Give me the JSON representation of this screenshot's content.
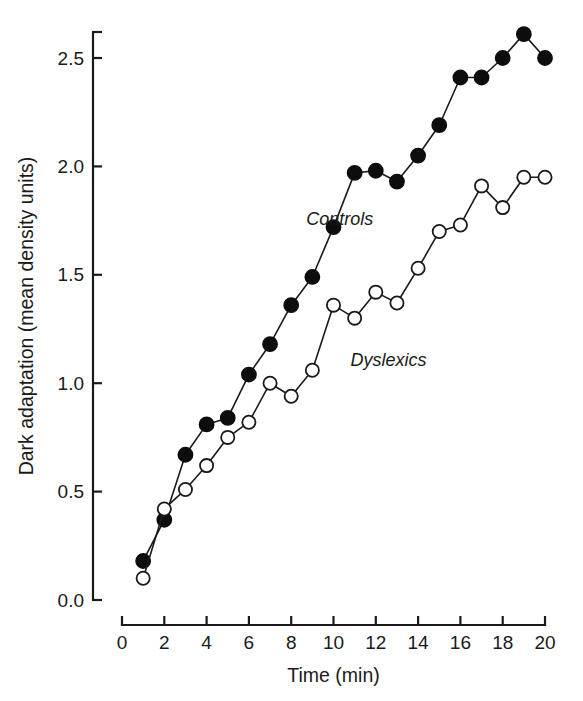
{
  "chart_data": {
    "type": "line",
    "title": "",
    "xlabel": "Time (min)",
    "ylabel": "Dark adaptation (mean density units)",
    "xlim": [
      0,
      20
    ],
    "ylim": [
      0.0,
      2.65
    ],
    "xticks": [
      "0",
      "2",
      "4",
      "6",
      "8",
      "10",
      "12",
      "14",
      "16",
      "18",
      "20"
    ],
    "xtick_values": [
      0,
      2,
      4,
      6,
      8,
      10,
      12,
      14,
      16,
      18,
      20
    ],
    "yticks": [
      "0.0",
      "0.5",
      "1.0",
      "1.5",
      "2.0",
      "2.5"
    ],
    "ytick_values": [
      0.0,
      0.5,
      1.0,
      1.5,
      2.0,
      2.5
    ],
    "grid": false,
    "legend_position": "inline-annotation",
    "x": [
      1,
      2,
      3,
      4,
      5,
      6,
      7,
      8,
      9,
      10,
      11,
      12,
      13,
      14,
      15,
      16,
      17,
      18,
      19,
      20
    ],
    "series": [
      {
        "name": "Controls",
        "marker": "filled-circle",
        "color": "#0d0d0d",
        "label_x": 10.3,
        "label_y": 1.73,
        "values": [
          0.18,
          0.37,
          0.67,
          0.81,
          0.84,
          1.04,
          1.18,
          1.36,
          1.49,
          1.72,
          1.97,
          1.98,
          1.93,
          2.05,
          2.19,
          2.41,
          2.41,
          2.5,
          2.61,
          2.5
        ]
      },
      {
        "name": "Dyslexics",
        "marker": "open-circle",
        "color": "#1a1a1a",
        "label_x": 12.6,
        "label_y": 1.08,
        "values": [
          0.1,
          0.42,
          0.51,
          0.62,
          0.75,
          0.82,
          1.0,
          0.94,
          1.06,
          1.36,
          1.3,
          1.42,
          1.37,
          1.53,
          1.7,
          1.73,
          1.91,
          1.81,
          1.95,
          1.95
        ]
      }
    ],
    "annotations": [
      {
        "text": "Controls",
        "style": "italic"
      },
      {
        "text": "Dyslexics",
        "style": "italic"
      }
    ]
  },
  "figure": {
    "background": "#ffffff",
    "axis_color": "#1a1a1a"
  }
}
